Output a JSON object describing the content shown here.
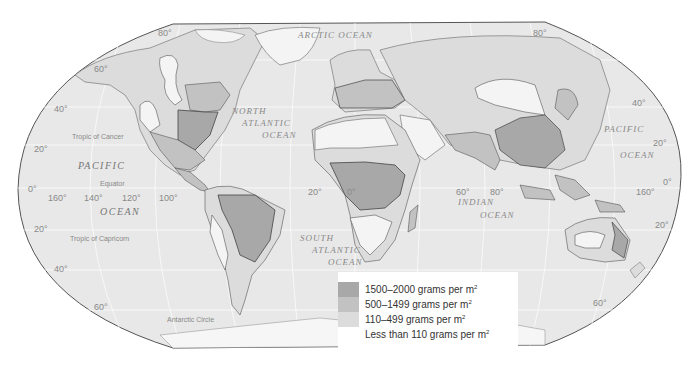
{
  "map": {
    "subject": "World net primary productivity",
    "colors": {
      "ocean": "#e8e8e8",
      "land_low": "#f4f4f4",
      "land_110_499": "#dcdcdc",
      "land_500_1499": "#c2c2c2",
      "land_1500_2000": "#a8a8a8",
      "border": "#555555",
      "grid": "#ffffff"
    },
    "ocean_labels": {
      "arctic": "ARCTIC",
      "arctic_ocean": "OCEAN",
      "north_atlantic_1": "NORTH",
      "north_atlantic_2": "ATLANTIC",
      "north_atlantic_3": "OCEAN",
      "pacific_w": "PACIFIC",
      "pacific_w_ocean": "OCEAN",
      "pacific_e": "PACIFIC",
      "pacific_e_ocean": "OCEAN",
      "south_atlantic_1": "SOUTH",
      "south_atlantic_2": "ATLANTIC",
      "south_atlantic_3": "OCEAN",
      "indian_1": "INDIAN",
      "indian_2": "OCEAN"
    },
    "lines": {
      "tropic_cancer": "Tropic of Cancer",
      "equator": "Equator",
      "tropic_capricorn": "Tropic of Capricorn",
      "antarctic_circle": "Antarctic Circle"
    },
    "degree_labels": {
      "lat_80_w": "80°",
      "lat_60_w": "60°",
      "lat_40_w": "40°",
      "lat_20_w": "20°",
      "lat_0_w": "0°",
      "lat_s20_w": "20°",
      "lat_s40_w": "40°",
      "lat_s60_w": "60°",
      "lat_80_e": "80°",
      "lat_40_e": "40°",
      "lat_20_e": "20°",
      "lat_0_e": "0°",
      "lat_s20_e": "20°",
      "lat_s60_e": "60°",
      "lon_160w": "160°",
      "lon_140w": "140°",
      "lon_120w": "120°",
      "lon_100w": "100°",
      "lon_20w": "20°",
      "lon_0": "0°",
      "lon_60e": "60°",
      "lon_80e": "80°",
      "lon_160e": "160°"
    }
  },
  "legend": {
    "items": [
      {
        "label": "1500–2000 grams per m",
        "sup": "2",
        "color": "#a8a8a8"
      },
      {
        "label": "500–1499 grams per m",
        "sup": "2",
        "color": "#c2c2c2"
      },
      {
        "label": "110–499 grams per m",
        "sup": "2",
        "color": "#dcdcdc"
      },
      {
        "label": "Less than 110 grams per m",
        "sup": "2",
        "color": "#f4f4f4"
      }
    ]
  }
}
